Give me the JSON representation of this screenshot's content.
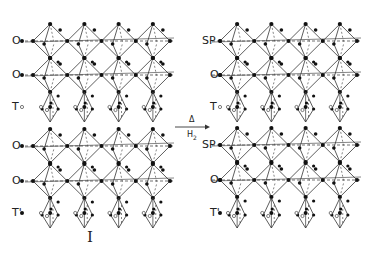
{
  "diagram": {
    "left_structure": {
      "id": "I",
      "layers": [
        {
          "label": "O",
          "y": 41
        },
        {
          "label": "O",
          "y": 75
        },
        {
          "label": "T",
          "y": 107
        },
        {
          "label": "O",
          "y": 146
        },
        {
          "label": "O",
          "y": 181
        },
        {
          "label": "T'",
          "y": 213
        }
      ],
      "x_label": 12,
      "x_start": 30,
      "x_end": 170
    },
    "right_structure": {
      "layers": [
        {
          "label": "SP",
          "y": 41
        },
        {
          "label": "O",
          "y": 75
        },
        {
          "label": "T",
          "y": 107
        },
        {
          "label": "SP",
          "y": 145
        },
        {
          "label": "O",
          "y": 180
        },
        {
          "label": "T'",
          "y": 213
        }
      ],
      "x_label": 210,
      "x_start": 217,
      "x_end": 357
    },
    "transformation_arrow": {
      "above": "Δ",
      "below": "H2",
      "x1": 175,
      "x2": 210,
      "y": 127
    },
    "colors": {
      "line": "#333333",
      "atom_filled": "#111111",
      "atom_open": "#444444",
      "background": "#ffffff"
    }
  }
}
